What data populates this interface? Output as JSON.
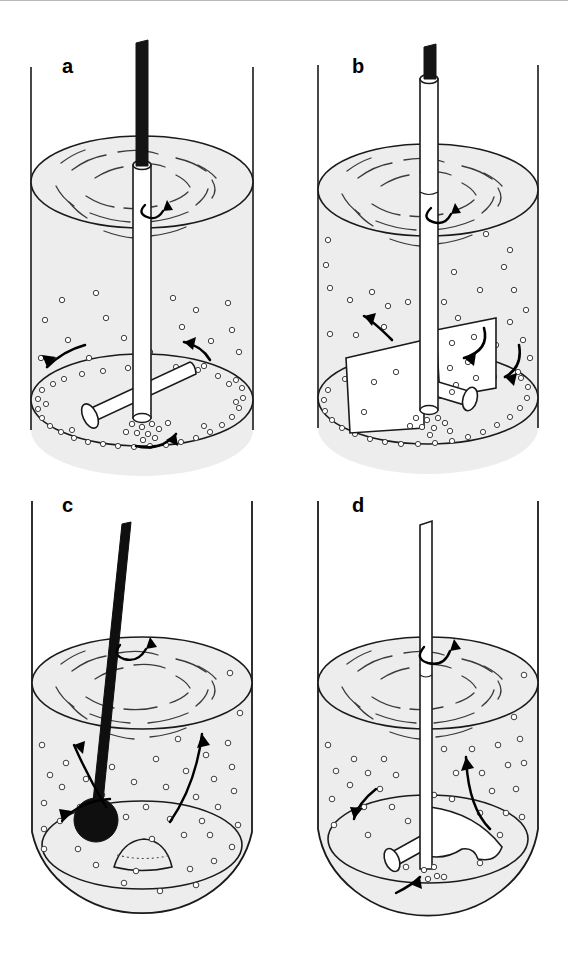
{
  "figure": {
    "type": "scientific-illustration",
    "panel_count": 4,
    "background_color": "#ffffff",
    "line_color": "#1a1a1a",
    "liquid_fill_color": "#ededed",
    "solid_part_color": "#000000",
    "width": 568,
    "height": 955
  },
  "panels": [
    {
      "id": "a",
      "label": "a",
      "label_x": 62,
      "label_y": 56,
      "impeller": "horizontal-cross-bar-impeller",
      "shaft": "vertical-black-rod-with-white-sleeve",
      "sparger": "horizontal-tube-below-impeller",
      "bubbles": "sparse-rising-bubbles-with-rim-ring",
      "vessel_bottom": "flat-elliptical-base",
      "arrows": [
        "surface-rotation-arrow",
        "left-flow-arrow",
        "right-flow-arrow",
        "bottom-circulation-arrow"
      ]
    },
    {
      "id": "b",
      "label": "b",
      "label_x": 352,
      "label_y": 56,
      "impeller": "flat-blade-paddle-impeller",
      "shaft": "vertical-black-rod-with-white-sleeve",
      "sparger": "horizontal-tube-at-impeller-hub",
      "bubbles": "dense-rising-bubbles-with-rim-ring",
      "vessel_bottom": "flat-elliptical-base",
      "arrows": [
        "surface-rotation-arrow",
        "left-upward-arrow",
        "inner-downward-arrow",
        "outer-downward-arrow"
      ]
    },
    {
      "id": "c",
      "label": "c",
      "label_x": 62,
      "label_y": 495,
      "impeller": "tilted-rod-with-spherical-ball-tip",
      "shaft": "inclined-solid-black-rod",
      "sparger": "none",
      "bubbles": "dense-uniform-bubbles",
      "vessel_bottom": "rounded-dished-base-with-sediment-mound",
      "arrows": [
        "surface-rotation-arrow",
        "left-outward-arrow",
        "left-low-arrow",
        "right-upward-arrow",
        "center-upward-arrow"
      ]
    },
    {
      "id": "d",
      "label": "d",
      "label_x": 352,
      "label_y": 495,
      "impeller": "curved-marine-propeller-blade",
      "shaft": "vertical-white-rod",
      "sparger": "horizontal-tube-below-propeller",
      "bubbles": "dense-rising-bubbles",
      "vessel_bottom": "rounded-dished-base",
      "arrows": [
        "surface-rotation-arrow",
        "left-downward-arrow",
        "right-upward-arrow",
        "bottom-inlet-arrow"
      ]
    }
  ]
}
